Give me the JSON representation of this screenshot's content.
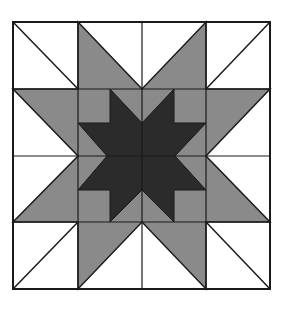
{
  "diagram": {
    "type": "quilt-block",
    "grid": {
      "rows": 4,
      "cols": 4
    },
    "colors": {
      "background": "#ffffff",
      "outer_star": "#8a8a8a",
      "inner_star": "#2b2b2b",
      "lines": "#1a1a1a"
    },
    "bounds": {
      "left": 13,
      "top": 22,
      "right": 270,
      "bottom": 289
    },
    "grid_x": [
      13,
      78,
      142,
      206,
      270
    ],
    "grid_y": [
      22,
      89,
      156,
      222,
      289
    ],
    "outer_star_points": "78,22 142,89 206,22 206,89 270,89 206,156 270,222 206,222 206,289 142,222 78,289 78,222 13,222 78,156 13,89 78,89",
    "inner_star_points": "110,89 142,123 174,89 174,123 206,123 175,156 206,190 174,190 174,222 142,190 110,222 110,190 78,190 107,156 78,123 110,123",
    "corner_diagonals": [
      {
        "x1": 13,
        "y1": 22,
        "x2": 78,
        "y2": 89
      },
      {
        "x1": 270,
        "y1": 22,
        "x2": 206,
        "y2": 89
      },
      {
        "x1": 13,
        "y1": 289,
        "x2": 78,
        "y2": 222
      },
      {
        "x1": 270,
        "y1": 289,
        "x2": 206,
        "y2": 222
      }
    ]
  }
}
